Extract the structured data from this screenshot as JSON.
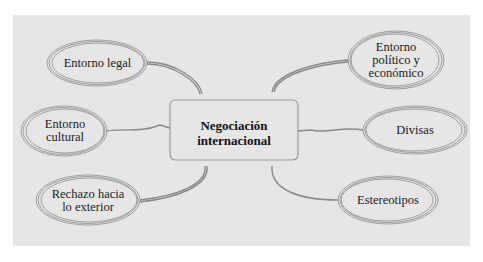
{
  "diagram": {
    "title": "Negociación internacional",
    "center": {
      "label": "Negociación\ninternacional"
    },
    "nodes": [
      {
        "id": "legal",
        "label": "Entorno legal",
        "side": "left"
      },
      {
        "id": "cultural",
        "label": "Entorno\ncultural",
        "side": "left"
      },
      {
        "id": "rechazo",
        "label": "Rechazo hacia\nlo exterior",
        "side": "left"
      },
      {
        "id": "politico",
        "label": "Entorno\npolítico y\neconómico",
        "side": "right"
      },
      {
        "id": "divisas",
        "label": "Divisas",
        "side": "right"
      },
      {
        "id": "estereotipos",
        "label": "Estereotipos",
        "side": "right"
      }
    ],
    "colors": {
      "panel": "#e6e6e6",
      "stroke": "#8c8c8c",
      "text": "#1a1a1a"
    }
  }
}
